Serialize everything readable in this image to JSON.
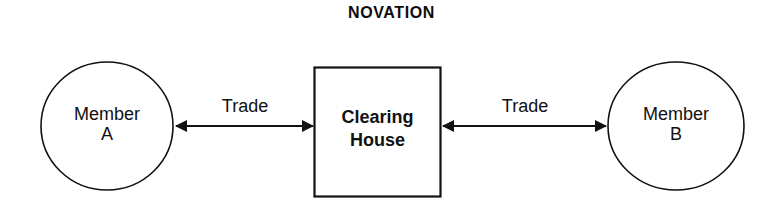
{
  "diagram": {
    "title": "NOVATION",
    "type": "flow-diagram",
    "background_color": "#ffffff",
    "stroke_color": "#111111",
    "nodes": [
      {
        "id": "member-a",
        "shape": "ellipse",
        "label_line1": "Member",
        "label_line2": "A"
      },
      {
        "id": "clearing-house",
        "shape": "rectangle",
        "label_line1": "Clearing",
        "label_line2": "House"
      },
      {
        "id": "member-b",
        "shape": "ellipse",
        "label_line1": "Member",
        "label_line2": "B"
      }
    ],
    "edges": [
      {
        "id": "edge-left",
        "label": "Trade",
        "from": "member-a",
        "to": "clearing-house",
        "arrowheads": "both"
      },
      {
        "id": "edge-right",
        "label": "Trade",
        "from": "clearing-house",
        "to": "member-b",
        "arrowheads": "both"
      }
    ]
  }
}
